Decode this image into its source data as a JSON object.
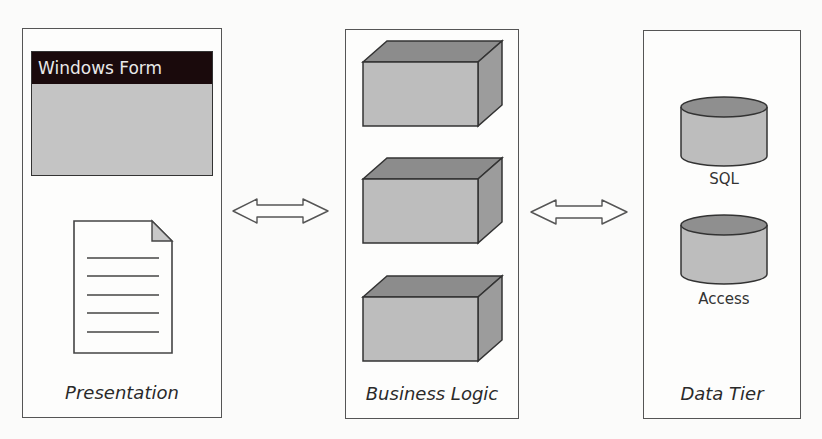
{
  "diagram": {
    "type": "three-tier-architecture",
    "tiers": [
      {
        "label": "Presentation",
        "components": [
          {
            "kind": "window",
            "title": "Windows Form"
          },
          {
            "kind": "document",
            "lines": 5
          }
        ]
      },
      {
        "label": "Business Logic",
        "components": [
          {
            "kind": "box"
          },
          {
            "kind": "box"
          },
          {
            "kind": "box"
          }
        ]
      },
      {
        "label": "Data Tier",
        "components": [
          {
            "kind": "database",
            "label": "SQL"
          },
          {
            "kind": "database",
            "label": "Access"
          }
        ]
      }
    ],
    "connectors": [
      {
        "from": "Presentation",
        "to": "Business Logic",
        "type": "bidirectional-arrow"
      },
      {
        "from": "Business Logic",
        "to": "Data Tier",
        "type": "bidirectional-arrow"
      }
    ],
    "colors": {
      "form_title_bg": "#1a0a0c",
      "form_body": "#c4c4c4",
      "box_front": "#bdbdbd",
      "box_top": "#8c8c8c",
      "box_side": "#9c9c9c",
      "cyl_body": "#bdbdbd",
      "cyl_top": "#8f8f8f"
    }
  }
}
